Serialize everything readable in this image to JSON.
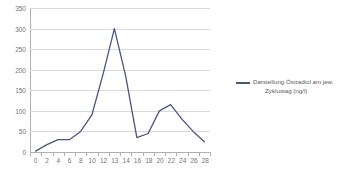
{
  "chart_data": {
    "type": "line",
    "title": "",
    "xlabel": "",
    "ylabel": "",
    "categories": [
      "0",
      "2",
      "4",
      "6",
      "8",
      "10",
      "12",
      "13",
      "14",
      "16",
      "18",
      "20",
      "22",
      "24",
      "26",
      "28"
    ],
    "values": [
      2,
      18,
      30,
      30,
      50,
      90,
      190,
      300,
      185,
      35,
      45,
      100,
      115,
      80,
      50,
      25
    ],
    "series": [
      {
        "name": "Darstellung Östradiol am jew. Zyklustag (ng/l)",
        "values": [
          2,
          18,
          30,
          30,
          50,
          90,
          190,
          300,
          185,
          35,
          45,
          100,
          115,
          80,
          50,
          25
        ]
      }
    ],
    "ylim": [
      0,
      350
    ],
    "y_ticks": [
      "0",
      "50",
      "100",
      "150",
      "200",
      "250",
      "300",
      "350"
    ],
    "y_tick_values": [
      0,
      50,
      100,
      150,
      200,
      250,
      300,
      350
    ],
    "grid": true,
    "legend_position": "right",
    "series_color": "#4a5584",
    "grid_color": "#d9d9d9",
    "axis_color": "#b0b0b0",
    "tick_label_color": "#737373"
  },
  "legend": {
    "entries": [
      {
        "label_line1": "Darstellung Östradiol am jew.",
        "label_line2": "Zyklustag (ng/l)",
        "color": "#4a5584"
      }
    ]
  }
}
